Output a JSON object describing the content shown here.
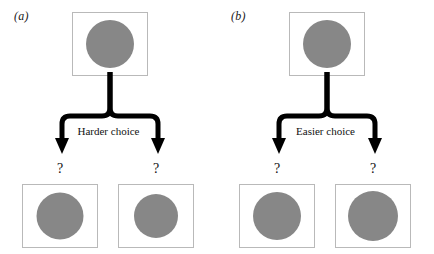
{
  "figure": {
    "type": "diagram",
    "background_color": "#ffffff",
    "disc_color": "#878787",
    "box_border_color": "#b9b9b9",
    "arrow_color": "#000000"
  },
  "panels": [
    {
      "id": "a",
      "label": "(a)",
      "choice_label": "Easier choice",
      "reference": {
        "name": "reference-disc",
        "diameter": 48
      },
      "options": [
        {
          "position": "left",
          "marker": "?",
          "diameter": 47
        },
        {
          "position": "right",
          "marker": "?",
          "diameter": 44
        }
      ]
    },
    {
      "id": "b",
      "label": "(b)",
      "choice_label": "Easier choice",
      "reference": {
        "name": "reference-disc",
        "diameter": 48
      },
      "options": [
        {
          "position": "left",
          "marker": "?",
          "diameter": 48
        },
        {
          "position": "right",
          "marker": "?",
          "diameter": 50
        }
      ]
    }
  ],
  "labels": {
    "panel_a": "(a)",
    "panel_b": "(b)",
    "harder_choice": "Harder choice",
    "easier_choice": "Easier choice",
    "question_mark": "?"
  }
}
